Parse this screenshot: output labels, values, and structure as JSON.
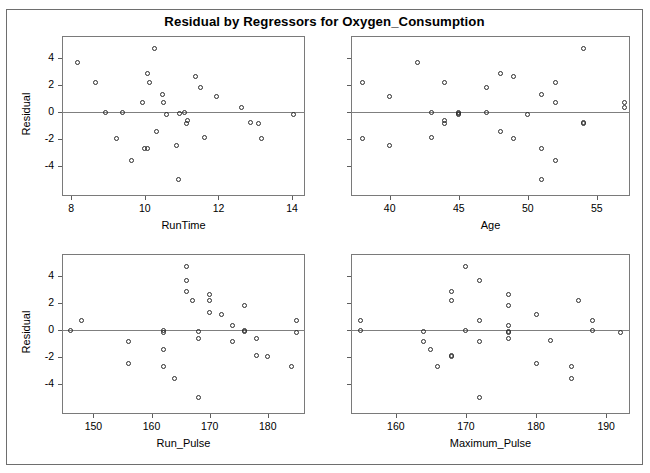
{
  "title": "Residual by Regressors for Oxygen_Consumption",
  "ghost_text": "",
  "colors": {
    "frame": "#6e6e6e",
    "panel_border": "#7a7a7a",
    "reference_line": "#7f7f7f",
    "marker": "#2b2b2b",
    "text": "#000000",
    "background": "#ffffff"
  },
  "shared": {
    "ylabel": "Residual",
    "yticks": [
      4,
      2,
      0,
      -2,
      -4
    ],
    "ylim": [
      -6.2,
      5.6
    ],
    "marker": "open-circle",
    "grid": false,
    "legend": null,
    "reference_y": 0
  },
  "chart_data": [
    {
      "type": "scatter",
      "panel": "top-left",
      "title": "Residual by Regressors for Oxygen_Consumption",
      "xlabel": "RunTime",
      "ylabel": "Residual",
      "xticks": [
        8,
        10,
        12,
        14
      ],
      "xlim": [
        7.75,
        14.35
      ],
      "ylim": [
        -6.2,
        5.6
      ],
      "yticks": [
        4,
        2,
        0,
        -2,
        -4
      ],
      "grid": false,
      "reference_line_y": 0,
      "marker": "open-circle",
      "x": [
        8.17,
        8.65,
        8.92,
        9.22,
        9.4,
        9.63,
        9.93,
        10.0,
        10.07,
        10.08,
        10.13,
        10.25,
        10.33,
        10.47,
        10.5,
        10.6,
        10.85,
        10.91,
        10.95,
        11.08,
        11.12,
        11.17,
        11.37,
        11.5,
        11.63,
        11.95,
        12.63,
        12.88,
        13.08,
        13.17,
        14.03
      ],
      "y": [
        3.62,
        2.18,
        -0.02,
        -1.93,
        -0.01,
        -3.58,
        0.71,
        -2.72,
        -2.66,
        2.85,
        2.17,
        4.65,
        -1.44,
        1.27,
        0.67,
        -0.18,
        -2.47,
        -5.0,
        -0.09,
        -0.05,
        -0.82,
        -0.64,
        2.63,
        1.8,
        -1.9,
        1.13,
        0.31,
        -0.78,
        -0.82,
        -1.94,
        -0.2
      ]
    },
    {
      "type": "scatter",
      "panel": "top-right",
      "xlabel": "Age",
      "ylabel": "Residual",
      "xticks": [
        40,
        45,
        50,
        55
      ],
      "xlim": [
        37.2,
        57.4
      ],
      "ylim": [
        -6.2,
        5.6
      ],
      "yticks": [
        4,
        2,
        0,
        -2,
        -4
      ],
      "grid": false,
      "reference_line_y": 0,
      "marker": "open-circle",
      "x": [
        38,
        38,
        40,
        40,
        42,
        43,
        43,
        44,
        44,
        44,
        45,
        45,
        45,
        47,
        47,
        48,
        48,
        49,
        49,
        50,
        51,
        51,
        51,
        52,
        52,
        52,
        54,
        54,
        54,
        57,
        57
      ],
      "y": [
        2.18,
        -1.93,
        1.13,
        -2.47,
        3.62,
        -0.02,
        -1.9,
        -0.64,
        -0.82,
        2.17,
        -0.05,
        -0.18,
        -0.09,
        1.8,
        -0.01,
        2.85,
        -1.44,
        2.63,
        -1.94,
        -0.2,
        1.27,
        -2.66,
        -5.0,
        2.17,
        0.71,
        -3.58,
        4.65,
        -0.78,
        -0.82,
        0.67,
        0.31
      ]
    },
    {
      "type": "scatter",
      "panel": "bottom-left",
      "xlabel": "Run_Pulse",
      "ylabel": "Residual",
      "xticks": [
        150,
        160,
        170,
        180
      ],
      "xlim": [
        144.6,
        186.4
      ],
      "ylim": [
        -6.2,
        5.6
      ],
      "yticks": [
        4,
        2,
        0,
        -2,
        -4
      ],
      "grid": false,
      "reference_line_y": 0,
      "marker": "open-circle",
      "x": [
        146,
        148,
        156,
        156,
        162,
        162,
        162,
        162,
        164,
        166,
        166,
        166,
        167,
        168,
        168,
        168,
        170,
        170,
        170,
        172,
        174,
        174,
        176,
        176,
        176,
        178,
        178,
        180,
        184,
        185,
        185
      ],
      "y": [
        -0.02,
        0.71,
        -0.82,
        -2.47,
        -0.05,
        -0.18,
        -1.44,
        -2.66,
        -3.58,
        4.65,
        3.62,
        2.85,
        2.17,
        -0.64,
        -5.0,
        -0.09,
        2.63,
        2.17,
        1.27,
        1.13,
        0.31,
        -0.82,
        1.8,
        -0.01,
        -0.09,
        -0.64,
        -1.9,
        -1.94,
        -2.66,
        0.67,
        -0.2
      ]
    },
    {
      "type": "scatter",
      "panel": "bottom-right",
      "xlabel": "Maximum_Pulse",
      "ylabel": "Residual",
      "xticks": [
        160,
        170,
        180,
        190
      ],
      "xlim": [
        153.6,
        193.4
      ],
      "ylim": [
        -6.2,
        5.6
      ],
      "yticks": [
        4,
        2,
        0,
        -2,
        -4
      ],
      "grid": false,
      "reference_line_y": 0,
      "marker": "open-circle",
      "x": [
        155,
        155,
        164,
        164,
        165,
        166,
        168,
        168,
        168,
        168,
        170,
        170,
        172,
        172,
        172,
        172,
        176,
        176,
        176,
        176,
        176,
        176,
        180,
        180,
        182,
        185,
        185,
        186,
        188,
        188,
        192
      ],
      "y": [
        0.71,
        -0.02,
        -0.09,
        -0.82,
        -1.44,
        -2.66,
        2.85,
        2.17,
        -1.9,
        -1.94,
        4.65,
        -0.05,
        3.62,
        0.71,
        -0.82,
        -5.0,
        2.63,
        1.8,
        0.31,
        -0.09,
        -0.18,
        -0.64,
        1.13,
        -2.47,
        -0.78,
        -2.72,
        -3.58,
        2.17,
        0.67,
        -0.01,
        -0.2
      ]
    }
  ]
}
